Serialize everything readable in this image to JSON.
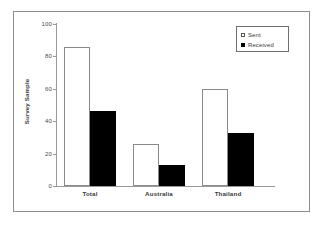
{
  "chart_data": {
    "type": "bar",
    "title": "",
    "xlabel": "",
    "ylabel": "Survey Sample",
    "categories": [
      "Total",
      "Australia",
      "Thailand"
    ],
    "series": [
      {
        "name": "Sent",
        "values": [
          86,
          26,
          60
        ],
        "color": "#ffffff",
        "marker": "open-square"
      },
      {
        "name": "Received",
        "values": [
          46,
          13,
          33
        ],
        "color": "#000000",
        "marker": "filled-square"
      }
    ],
    "ylim": [
      0,
      100
    ],
    "yticks": [
      0,
      20,
      40,
      60,
      80,
      100
    ],
    "ytick_labels": [
      "0",
      "20",
      "40",
      "60",
      "80",
      "100"
    ],
    "grid": false,
    "legend_position": "top-right",
    "legend_entries": [
      "Sent",
      "Received"
    ],
    "frame": true
  },
  "axis": {
    "y_title": "Survey Sample",
    "tick_labels": [
      "100",
      "80",
      "60",
      "40",
      "20",
      "0"
    ]
  },
  "legend": {
    "items": [
      {
        "label": "Sent"
      },
      {
        "label": "Received"
      }
    ]
  },
  "categories": [
    {
      "label": "Total"
    },
    {
      "label": "Australia"
    },
    {
      "label": "Thailand"
    }
  ]
}
